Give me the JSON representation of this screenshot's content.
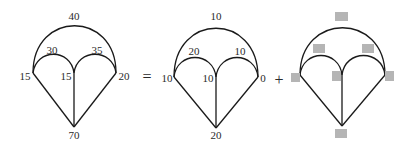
{
  "equation": {
    "operators": [
      "=",
      "+"
    ],
    "graphs": [
      {
        "name": "total",
        "labels": {
          "outer_arc": "40",
          "left_arc": "30",
          "right_arc": "35",
          "left_node": "15",
          "middle_node": "15",
          "right_node": "20",
          "bottom_node": "70"
        }
      },
      {
        "name": "first-term",
        "labels": {
          "outer_arc": "10",
          "left_arc": "20",
          "right_arc": "10",
          "left_node": "10",
          "middle_node": "10",
          "right_node": "0",
          "bottom_node": "20"
        }
      },
      {
        "name": "second-term",
        "labels": {
          "outer_arc": "",
          "left_arc": "",
          "right_arc": "",
          "left_node": "",
          "middle_node": "",
          "right_node": "",
          "bottom_node": ""
        },
        "blank_placeholders": true
      }
    ]
  }
}
